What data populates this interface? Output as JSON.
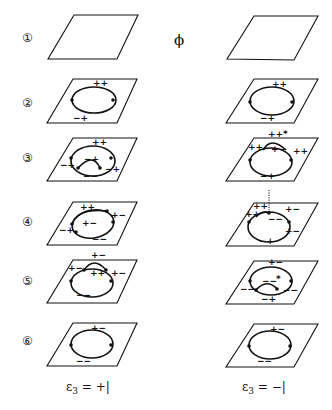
{
  "diagram": {
    "center_symbol": "ϕ",
    "rows": [
      {
        "index": 1,
        "label": "①",
        "left": {
          "labels": []
        },
        "right": {
          "labels": []
        }
      },
      {
        "index": 2,
        "label": "②",
        "left": {
          "labels": [
            "++",
            "−+"
          ]
        },
        "right": {
          "labels": [
            "++",
            "−+"
          ]
        }
      },
      {
        "index": 3,
        "label": "③",
        "left": {
          "labels": [
            "++",
            "−+",
            "−+",
            "−+",
            "−−"
          ]
        },
        "right": {
          "labels": [
            "++*",
            "++",
            "+−",
            "++",
            "−+"
          ]
        }
      },
      {
        "index": 4,
        "label": "④",
        "left": {
          "labels": [
            "++",
            "+−",
            "+−",
            "−+",
            "−−"
          ]
        },
        "right": {
          "labels": [
            "++",
            "++",
            "+−",
            "−−",
            "+−",
            "−+"
          ]
        }
      },
      {
        "index": 5,
        "label": "⑤",
        "left": {
          "labels": [
            "+−",
            "+−",
            "++",
            "+−",
            "−−"
          ]
        },
        "right": {
          "labels": [
            "+−",
            "−−",
            "*",
            "−−",
            "−−",
            "−+"
          ]
        }
      },
      {
        "index": 6,
        "label": "⑥",
        "left": {
          "labels": [
            "+−",
            "−−"
          ]
        },
        "right": {
          "labels": [
            "+−",
            "−−"
          ]
        }
      }
    ],
    "columns": [
      {
        "caption_main": "ε",
        "caption_sub": "3",
        "caption_value": " = +|"
      },
      {
        "caption_main": "ε",
        "caption_sub": "3",
        "caption_value": " = −|"
      }
    ]
  }
}
